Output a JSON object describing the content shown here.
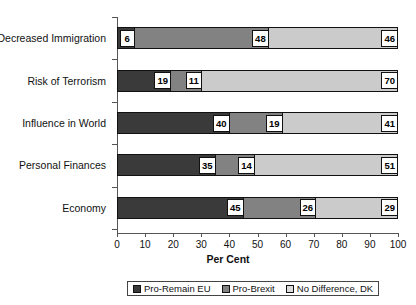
{
  "chart_data": {
    "type": "bar",
    "orientation": "horizontal",
    "stacked": true,
    "title": "",
    "xlabel": "Per Cent",
    "ylabel": "",
    "xlim": [
      0,
      100
    ],
    "xticks": [
      0,
      10,
      20,
      30,
      40,
      50,
      60,
      70,
      80,
      90,
      100
    ],
    "grid": false,
    "legend_position": "bottom",
    "categories": [
      "Decreased Immigration",
      "Risk of Terrorism",
      "Influence in World",
      "Personal Finances",
      "Economy"
    ],
    "series": [
      {
        "name": "Pro-Remain EU",
        "color": "#3a3a3a",
        "values": [
          6,
          19,
          40,
          35,
          45
        ]
      },
      {
        "name": "Pro-Brexit",
        "color": "#828282",
        "values": [
          48,
          11,
          19,
          14,
          26
        ]
      },
      {
        "name": "No Difference, DK",
        "color": "#cbcbcb",
        "values": [
          46,
          70,
          41,
          51,
          29
        ]
      }
    ]
  },
  "axis": {
    "x_title": "Per Cent",
    "tick_labels": [
      "0",
      "10",
      "20",
      "30",
      "40",
      "50",
      "60",
      "70",
      "80",
      "90",
      "100"
    ]
  },
  "legend": {
    "items": [
      {
        "label": "Pro-Remain EU"
      },
      {
        "label": "Pro-Brexit"
      },
      {
        "label": "No Difference, DK"
      }
    ]
  }
}
